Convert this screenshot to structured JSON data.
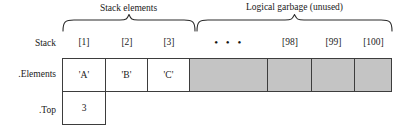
{
  "diagram": {
    "braces": [
      {
        "id": "stack-elements",
        "caption": "Stack elements"
      },
      {
        "id": "logical-garbage",
        "caption": "Logical garbage (unused)"
      }
    ],
    "row_labels": {
      "stack": "Stack",
      "elements": ".Elements",
      "top": ".Top"
    },
    "index_labels": {
      "i1": "[1]",
      "i2": "[2]",
      "i3": "[3]",
      "ellipsis": "• • •",
      "i98": "[98]",
      "i99": "[99]",
      "i100": "[100]"
    },
    "elements": {
      "cell1": "'A'",
      "cell2": "'B'",
      "cell3": "'C'",
      "gap": "",
      "cell98": "",
      "cell99": "",
      "cell100": ""
    },
    "top_value": "3",
    "colors": {
      "cell_border": "#3d3d3d",
      "garbage_fill": "#c4c4c4",
      "filled_fill": "#ffffff",
      "text": "#1a1a1a"
    }
  }
}
